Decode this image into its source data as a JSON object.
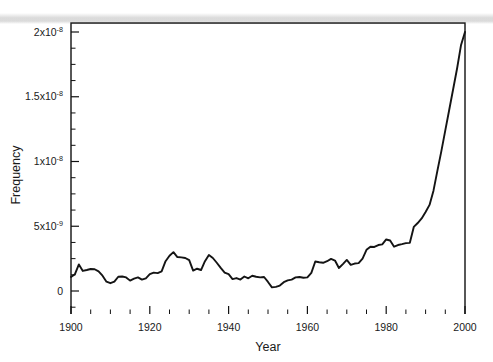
{
  "chart_data": {
    "type": "line",
    "title": "",
    "xlabel": "Year",
    "ylabel": "Frequency",
    "xlim": [
      1900,
      2000
    ],
    "ylim": [
      0,
      2e-08
    ],
    "grid": false,
    "legend": null,
    "xticks": [
      1900,
      1920,
      1940,
      1960,
      1980,
      2000
    ],
    "xtick_labels": [
      "1900",
      "1920",
      "1940",
      "1960",
      "1980",
      "2000"
    ],
    "xminor_step": 5,
    "yticks": [
      0,
      5e-09,
      1e-08,
      1.5e-08,
      2e-08
    ],
    "ytick_labels": [
      "0",
      "5x10-9",
      "1x10-8",
      "1.5x10-8",
      "2x10-8"
    ],
    "ytick_label_parts": [
      {
        "mantissa": "0",
        "times": "",
        "base": "",
        "exp": ""
      },
      {
        "mantissa": "5",
        "times": "x",
        "base": "10",
        "exp": "-9"
      },
      {
        "mantissa": "1",
        "times": "x",
        "base": "10",
        "exp": "-8"
      },
      {
        "mantissa": "1.5",
        "times": "x",
        "base": "10",
        "exp": "-8"
      },
      {
        "mantissa": "2",
        "times": "x",
        "base": "10",
        "exp": "-8"
      }
    ],
    "yminor_step": 1.25e-09,
    "series": [
      {
        "name": "Frequency",
        "color": "#141414",
        "x": [
          1900,
          1901,
          1902,
          1903,
          1904,
          1905,
          1906,
          1907,
          1908,
          1909,
          1910,
          1911,
          1912,
          1913,
          1914,
          1915,
          1916,
          1917,
          1918,
          1919,
          1920,
          1921,
          1922,
          1923,
          1924,
          1925,
          1926,
          1927,
          1928,
          1929,
          1930,
          1931,
          1932,
          1933,
          1934,
          1935,
          1936,
          1937,
          1938,
          1939,
          1940,
          1941,
          1942,
          1943,
          1944,
          1945,
          1946,
          1947,
          1948,
          1949,
          1950,
          1951,
          1952,
          1953,
          1954,
          1955,
          1956,
          1957,
          1958,
          1959,
          1960,
          1961,
          1962,
          1963,
          1964,
          1965,
          1966,
          1967,
          1968,
          1969,
          1970,
          1971,
          1972,
          1973,
          1974,
          1975,
          1976,
          1977,
          1978,
          1979,
          1980,
          1981,
          1982,
          1983,
          1984,
          1985,
          1986,
          1987,
          1988,
          1989,
          1990,
          1991,
          1992,
          1993,
          1994,
          1995,
          1996,
          1997,
          1998,
          1999,
          2000
        ],
        "y": [
          1.08e-09,
          1.3e-09,
          2.05e-09,
          1.55e-09,
          1.62e-09,
          1.7e-09,
          1.68e-09,
          1.52e-09,
          1.18e-09,
          7.2e-10,
          6e-10,
          7.2e-10,
          1.1e-09,
          1.12e-09,
          1.05e-09,
          8e-10,
          9.5e-10,
          1.05e-09,
          8.8e-10,
          9.8e-10,
          1.3e-09,
          1.42e-09,
          1.38e-09,
          1.52e-09,
          2.3e-09,
          2.72e-09,
          3e-09,
          2.62e-09,
          2.6e-09,
          2.55e-09,
          2.38e-09,
          1.58e-09,
          1.72e-09,
          1.62e-09,
          2.3e-09,
          2.78e-09,
          2.55e-09,
          2.18e-09,
          1.78e-09,
          1.42e-09,
          1.3e-09,
          9.2e-10,
          1e-09,
          8.8e-10,
          1.12e-09,
          9.8e-10,
          1.18e-09,
          1.1e-09,
          1.05e-09,
          1.08e-09,
          7e-10,
          2.8e-10,
          3.2e-10,
          4.2e-10,
          6.8e-10,
          8.2e-10,
          8.8e-10,
          1.05e-09,
          1.08e-09,
          1.02e-09,
          1.05e-09,
          1.4e-09,
          2.28e-09,
          2.22e-09,
          2.18e-09,
          2.3e-09,
          2.48e-09,
          2.35e-09,
          1.78e-09,
          2.08e-09,
          2.4e-09,
          2.02e-09,
          2.12e-09,
          2.15e-09,
          2.5e-09,
          3.18e-09,
          3.42e-09,
          3.4e-09,
          3.55e-09,
          3.6e-09,
          3.98e-09,
          3.9e-09,
          3.42e-09,
          3.55e-09,
          3.62e-09,
          3.7e-09,
          3.72e-09,
          4.95e-09,
          5.25e-09,
          5.6e-09,
          6.1e-09,
          6.65e-09,
          7.75e-09,
          9.3e-09,
          1.08e-08,
          1.24e-08,
          1.4e-08,
          1.56e-08,
          1.72e-08,
          1.9e-08,
          2e-08
        ]
      }
    ]
  },
  "figure": {
    "background_color": "#ffffff",
    "frame_color": "#111111",
    "artifact": "horizontal-scan-band"
  }
}
